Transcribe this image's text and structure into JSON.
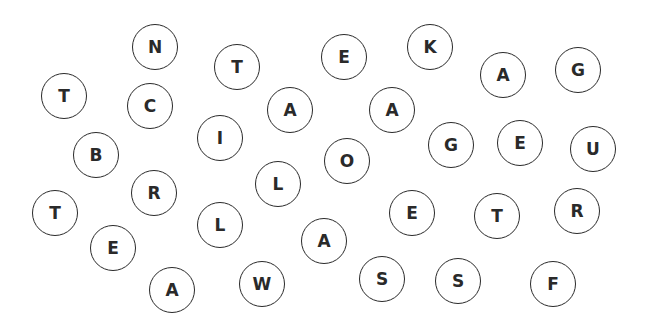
{
  "game": {
    "type": "letter-tile-board",
    "tile_border_color": "#2a2a2a",
    "background_color": "#ffffff",
    "tiles": [
      {
        "letter": "N",
        "x": 155,
        "y": 47
      },
      {
        "letter": "T",
        "x": 237,
        "y": 67
      },
      {
        "letter": "E",
        "x": 344,
        "y": 57
      },
      {
        "letter": "K",
        "x": 430,
        "y": 47
      },
      {
        "letter": "A",
        "x": 503,
        "y": 75
      },
      {
        "letter": "G",
        "x": 578,
        "y": 70
      },
      {
        "letter": "T",
        "x": 64,
        "y": 96
      },
      {
        "letter": "C",
        "x": 150,
        "y": 106
      },
      {
        "letter": "A",
        "x": 290,
        "y": 110
      },
      {
        "letter": "A",
        "x": 392,
        "y": 110
      },
      {
        "letter": "I",
        "x": 220,
        "y": 138
      },
      {
        "letter": "B",
        "x": 96,
        "y": 155
      },
      {
        "letter": "G",
        "x": 451,
        "y": 145
      },
      {
        "letter": "E",
        "x": 520,
        "y": 143
      },
      {
        "letter": "U",
        "x": 593,
        "y": 149
      },
      {
        "letter": "O",
        "x": 347,
        "y": 161
      },
      {
        "letter": "L",
        "x": 278,
        "y": 184
      },
      {
        "letter": "R",
        "x": 154,
        "y": 193
      },
      {
        "letter": "T",
        "x": 55,
        "y": 213
      },
      {
        "letter": "E",
        "x": 412,
        "y": 213
      },
      {
        "letter": "T",
        "x": 497,
        "y": 216
      },
      {
        "letter": "R",
        "x": 577,
        "y": 211
      },
      {
        "letter": "L",
        "x": 220,
        "y": 225
      },
      {
        "letter": "E",
        "x": 113,
        "y": 248
      },
      {
        "letter": "A",
        "x": 324,
        "y": 241
      },
      {
        "letter": "A",
        "x": 172,
        "y": 290
      },
      {
        "letter": "W",
        "x": 262,
        "y": 284
      },
      {
        "letter": "S",
        "x": 382,
        "y": 279
      },
      {
        "letter": "S",
        "x": 458,
        "y": 281
      },
      {
        "letter": "F",
        "x": 553,
        "y": 284
      }
    ]
  }
}
